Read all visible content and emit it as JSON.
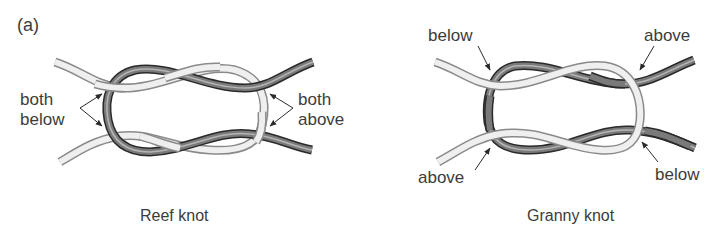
{
  "panel_label": "(a)",
  "reef_knot": {
    "caption": "Reef knot",
    "left_label": [
      "both",
      "below"
    ],
    "right_label": [
      "both",
      "above"
    ]
  },
  "granny_knot": {
    "caption": "Granny knot",
    "top_left_label": "below",
    "top_right_label": "above",
    "bottom_left_label": "above",
    "bottom_right_label": "below"
  },
  "colors": {
    "light_rope_fill": "#efefef",
    "light_rope_edge": "#8a8a8a",
    "dark_rope_fill": "#6e6e6e",
    "dark_rope_edge": "#2a2a2a",
    "arrow": "#2a2a2a",
    "text": "#3c3c3c"
  }
}
